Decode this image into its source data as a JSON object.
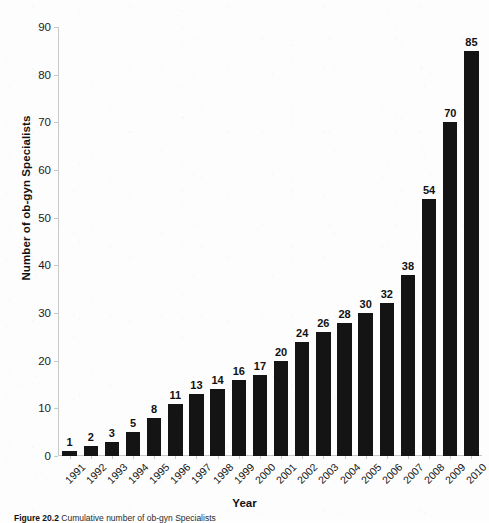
{
  "chart_data": {
    "type": "bar",
    "title": "",
    "xlabel": "Year",
    "ylabel": "Number of ob-gyn Specialists",
    "categories": [
      "1991",
      "1992",
      "1993",
      "1994",
      "1995",
      "1996",
      "1997",
      "1998",
      "1999",
      "2000",
      "2001",
      "2002",
      "2003",
      "2004",
      "2005",
      "2006",
      "2007",
      "2008",
      "2009",
      "2010"
    ],
    "values": [
      1,
      2,
      3,
      5,
      8,
      11,
      13,
      14,
      16,
      17,
      20,
      24,
      26,
      28,
      30,
      32,
      38,
      54,
      70,
      85
    ],
    "ylim": [
      0,
      90
    ],
    "yticks": [
      0,
      10,
      20,
      30,
      40,
      50,
      60,
      70,
      80,
      90
    ],
    "grid": false,
    "legend": false,
    "bar_color": "#141414",
    "background_color": "#fdfdfd",
    "axis_color": "#c9c9c9",
    "data_labels": true,
    "xtick_rotation": -45
  },
  "caption": {
    "figure_number": "Figure 20.2",
    "text": "Cumulative number of ob-gyn Specialists"
  }
}
